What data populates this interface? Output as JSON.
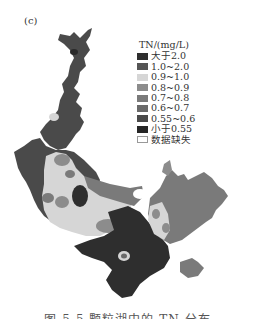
{
  "figure": {
    "panel_label": "(c)",
    "caption": "图 5-5 颗粒湖中的 TN 分布"
  },
  "legend": {
    "title": "TN/(mg/L)",
    "items": [
      {
        "label": "大于2.0",
        "color": "#2e2e2e"
      },
      {
        "label": "1.0~2.0",
        "color": "#555555"
      },
      {
        "label": "0.9~1.0",
        "color": "#d6d6d6"
      },
      {
        "label": "0.8~0.9",
        "color": "#8c8c8c"
      },
      {
        "label": "0.7~0.8",
        "color": "#7a7a7a"
      },
      {
        "label": "0.6~0.7",
        "color": "#6a6a6a"
      },
      {
        "label": "0.55~0.6",
        "color": "#4a4a4a"
      },
      {
        "label": "小于0.55",
        "color": "#262626"
      },
      {
        "label": "数据缺失",
        "color": "#ffffff"
      }
    ]
  }
}
